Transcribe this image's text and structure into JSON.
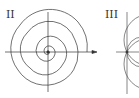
{
  "panels": [
    {
      "label": "II",
      "type": "spiral"
    },
    {
      "label": "III",
      "type": "tangent-circles"
    }
  ],
  "colors": {
    "stroke": "#333333",
    "background": "#ffffff"
  }
}
